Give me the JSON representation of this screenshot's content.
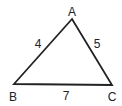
{
  "diagram": {
    "type": "triangle",
    "stroke_color": "#222222",
    "vertices": [
      {
        "label": "A",
        "x": 72,
        "y": 19,
        "lx": 72,
        "ly": 16
      },
      {
        "label": "B",
        "x": 14,
        "y": 84,
        "lx": 13,
        "ly": 101
      },
      {
        "label": "C",
        "x": 112,
        "y": 85,
        "lx": 112,
        "ly": 101
      }
    ],
    "sides": [
      {
        "between": "AB",
        "length": "4",
        "lx": 38,
        "ly": 48
      },
      {
        "between": "AC",
        "length": "5",
        "lx": 97,
        "ly": 48
      },
      {
        "between": "BC",
        "length": "7",
        "lx": 66,
        "ly": 100
      }
    ]
  }
}
